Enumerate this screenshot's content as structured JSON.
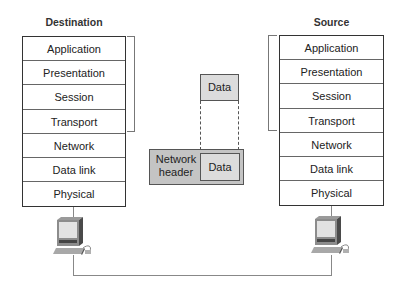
{
  "destination": {
    "title": "Destination",
    "layers": [
      "Application",
      "Presentation",
      "Session",
      "Transport",
      "Network",
      "Data link",
      "Physical"
    ]
  },
  "source": {
    "title": "Source",
    "layers": [
      "Application",
      "Presentation",
      "Session",
      "Transport",
      "Network",
      "Data link",
      "Physical"
    ]
  },
  "middle": {
    "data_label": "Data",
    "network_header_label": "Network header",
    "network_header_line1": "Network",
    "network_header_line2": "header",
    "encapsulated_data_label": "Data"
  },
  "colors": {
    "data_box": "#dcdcdc",
    "network_header_box": "#c4c4c4",
    "line": "#333333"
  }
}
